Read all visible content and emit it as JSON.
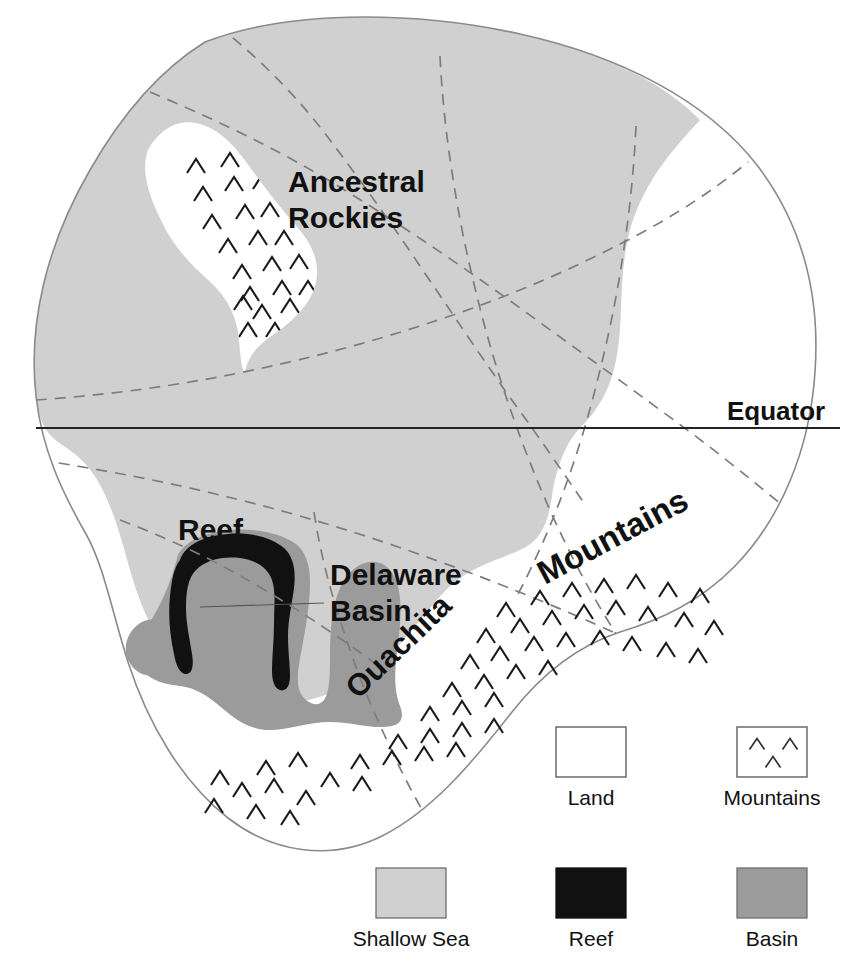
{
  "map": {
    "title": "Late Paleozoic Paleogeographic Map",
    "equator": {
      "label": "Equator",
      "line_y": 428
    },
    "features": [
      {
        "id": "ancestral-rockies",
        "label": "Ancestral Rockies",
        "line1": "Ancestral",
        "line2": "Rockies",
        "type": "mountains"
      },
      {
        "id": "reef",
        "label": "Reef",
        "type": "reef"
      },
      {
        "id": "delaware-basin",
        "label": "Delaware Basin",
        "line1": "Delaware",
        "line2": "Basin",
        "type": "basin"
      },
      {
        "id": "ouachita",
        "label": "Ouachita",
        "type": "mountains"
      },
      {
        "id": "mountains",
        "label": "Mountains",
        "type": "mountains"
      }
    ]
  },
  "legend": {
    "items": [
      {
        "key": "land",
        "label": "Land",
        "swatch": "outline",
        "color": "#ffffff"
      },
      {
        "key": "mountains",
        "label": "Mountains",
        "swatch": "chevrons",
        "color": "#ffffff"
      },
      {
        "key": "shallow-sea",
        "label": "Shallow Sea",
        "swatch": "fill",
        "color": "#d0d0d0"
      },
      {
        "key": "reef",
        "label": "Reef",
        "swatch": "fill",
        "color": "#111111"
      },
      {
        "key": "basin",
        "label": "Basin",
        "swatch": "fill",
        "color": "#9b9b9b"
      }
    ]
  },
  "colors": {
    "shallow_sea": "#d0d0d0",
    "basin": "#9b9b9b",
    "reef": "#111111",
    "land": "#ffffff",
    "coastline": "#8a8a8a",
    "boundary_dashed": "#7d7d7d",
    "equator_line": "#222222",
    "text": "#111111"
  }
}
